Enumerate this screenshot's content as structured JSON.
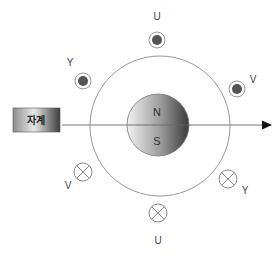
{
  "diagram": {
    "type": "magnet-rotor-coil-diagram",
    "box": {
      "label": "자계"
    },
    "magnet": {
      "north_label": "N",
      "south_label": "S"
    },
    "conductors": [
      {
        "label": "U",
        "position": "top",
        "direction": "dot"
      },
      {
        "label": "Y",
        "position": "upper-left",
        "direction": "dot"
      },
      {
        "label": "V",
        "position": "upper-right",
        "direction": "dot"
      },
      {
        "label": "V",
        "position": "lower-left",
        "direction": "cross"
      },
      {
        "label": "Y",
        "position": "lower-right",
        "direction": "cross"
      },
      {
        "label": "U",
        "position": "bottom",
        "direction": "cross"
      }
    ],
    "colors": {
      "line": "#888888",
      "dot_fill": "#555555",
      "arrow": "#111111"
    }
  }
}
